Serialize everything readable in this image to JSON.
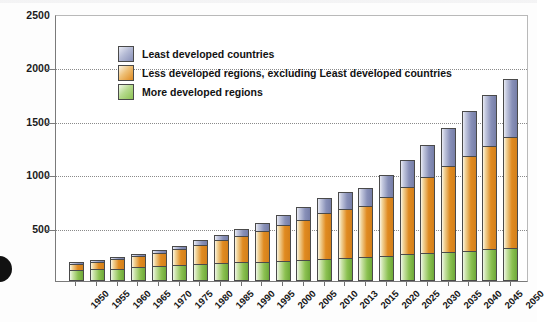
{
  "chart_data": {
    "type": "bar",
    "title": "",
    "subtitle": "",
    "xlabel": "",
    "ylabel": "Millions",
    "ylim": [
      0,
      2500
    ],
    "yticks": [
      500,
      1000,
      1500,
      2000,
      2500
    ],
    "ytick_labels": [
      "500",
      "1000",
      "1500",
      "2000",
      "2500"
    ],
    "grid": true,
    "stacked": true,
    "legend_position": "top-left",
    "categories": [
      "1950",
      "1955",
      "1960",
      "1965",
      "1970",
      "1975",
      "1980",
      "1985",
      "1990",
      "1995",
      "2000",
      "2005",
      "2010",
      "2013",
      "2015",
      "2020",
      "2025",
      "2030",
      "2035",
      "2040",
      "2045",
      "2050"
    ],
    "series": [
      {
        "name": "More developed regions",
        "color": "#8cc152",
        "values": [
          100,
          108,
          117,
          127,
          138,
          148,
          157,
          166,
          174,
          182,
          190,
          199,
          210,
          216,
          221,
          235,
          249,
          262,
          274,
          285,
          296,
          306
        ]
      },
      {
        "name": "Less developed regions, excluding Least developed countries",
        "color": "#e08a20",
        "values": [
          63,
          74,
          88,
          104,
          126,
          152,
          183,
          214,
          250,
          288,
          330,
          377,
          429,
          463,
          486,
          556,
          634,
          715,
          800,
          884,
          965,
          1040
        ]
      },
      {
        "name": "Least developed countries",
        "color": "#8890b8",
        "values": [
          12,
          14,
          17,
          21,
          26,
          32,
          40,
          50,
          62,
          77,
          94,
          114,
          137,
          154,
          165,
          202,
          247,
          298,
          356,
          419,
          484,
          548
        ]
      }
    ],
    "totals": [
      175,
      196,
      222,
      252,
      290,
      332,
      380,
      430,
      486,
      547,
      614,
      690,
      776,
      833,
      872,
      993,
      1130,
      1275,
      1430,
      1588,
      1745,
      1894
    ]
  },
  "legend": {
    "items": [
      {
        "label": "Least developed countries",
        "key": "least"
      },
      {
        "label": "Less developed regions, excluding Least developed countries",
        "key": "less"
      },
      {
        "label": "More developed regions",
        "key": "more"
      }
    ]
  },
  "axes": {
    "y_title": "Millions"
  }
}
